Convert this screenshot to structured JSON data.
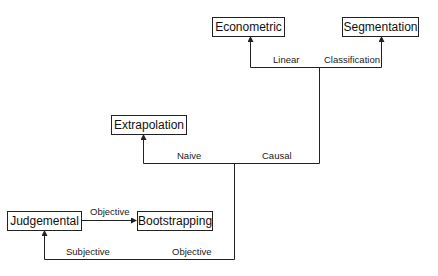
{
  "diagram": {
    "type": "decision-tree",
    "nodes": {
      "econometric": "Econometric",
      "segmentation": "Segmentation",
      "extrapolation": "Extrapolation",
      "judgemental": "Judgemental",
      "bootstrapping": "Bootstrapping"
    },
    "edge_labels": {
      "linear": "Linear",
      "classification": "Classification",
      "naive": "Naive",
      "causal": "Causal",
      "subjective": "Subjective",
      "objective_bottom": "Objective",
      "objective_arrow": "Objective"
    },
    "edges": [
      {
        "from": "Objective (root)",
        "to": "Judgemental",
        "label": "Subjective"
      },
      {
        "from": "Objective (root)",
        "to": "Naive/Causal split",
        "label": "Objective"
      },
      {
        "from": "Naive/Causal split",
        "to": "Extrapolation",
        "label": "Naive"
      },
      {
        "from": "Naive/Causal split",
        "to": "Linear/Classification split",
        "label": "Causal"
      },
      {
        "from": "Linear/Classification split",
        "to": "Econometric",
        "label": "Linear"
      },
      {
        "from": "Linear/Classification split",
        "to": "Segmentation",
        "label": "Classification"
      },
      {
        "from": "Judgemental",
        "to": "Bootstrapping",
        "label": "Objective"
      }
    ],
    "colors": {
      "line": "#222222",
      "background": "#ffffff",
      "text": "#111111"
    }
  }
}
